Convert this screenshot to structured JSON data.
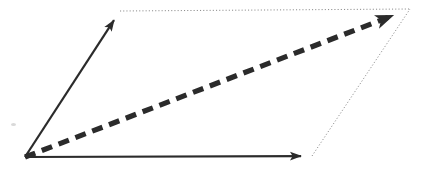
{
  "figure": {
    "type": "line-diagram",
    "width": 428,
    "height": 172,
    "background_color": "#ffffff"
  },
  "chart_data": {
    "type": "line",
    "xlabel": "",
    "ylabel": "",
    "xlim": [
      0,
      428
    ],
    "ylim": [
      172,
      0
    ],
    "grid": false,
    "legend": "none",
    "coordinate_system": "pixel (origin top-left, y increases downward)",
    "points": {
      "origin": [
        25,
        157
      ],
      "vector_a_tip": [
        120,
        11
      ],
      "vector_b_tip": [
        312,
        156
      ],
      "resultant_tip": [
        410,
        9
      ]
    },
    "series": [
      {
        "name": "vector-a",
        "style": "solid",
        "arrow": "end",
        "color": "#2b2b2b",
        "width": 2.2,
        "x": [
          25,
          120
        ],
        "y": [
          157,
          11
        ]
      },
      {
        "name": "vector-b",
        "style": "solid",
        "arrow": "end",
        "color": "#2b2b2b",
        "width": 2.2,
        "x": [
          25,
          312
        ],
        "y": [
          157,
          156
        ]
      },
      {
        "name": "resultant",
        "style": "dashed",
        "arrow": "end",
        "color": "#2b2b2b",
        "width": 5.2,
        "dash_length": 11,
        "dash_gap": 7,
        "x": [
          25,
          410
        ],
        "y": [
          157,
          9
        ]
      },
      {
        "name": "construction-top",
        "style": "dotted",
        "arrow": "none",
        "color": "#8a8a8a",
        "width": 1,
        "x": [
          120,
          410
        ],
        "y": [
          11,
          9
        ]
      },
      {
        "name": "construction-right",
        "style": "dotted",
        "arrow": "none",
        "color": "#8a8a8a",
        "width": 1,
        "x": [
          312,
          410
        ],
        "y": [
          156,
          9
        ]
      }
    ],
    "annotations": [
      {
        "name": "scan-smudge",
        "x": 12,
        "y": 124,
        "width": 5,
        "height": 3,
        "color": "#d9d9d9"
      }
    ]
  },
  "colors": {
    "stroke_solid": "#2b2b2b",
    "stroke_dashed": "#2b2b2b",
    "stroke_dotted": "#8a8a8a",
    "background": "#ffffff",
    "smudge": "#d9d9d9"
  },
  "labels": {
    "vector_a": "",
    "vector_b": "",
    "resultant": ""
  }
}
